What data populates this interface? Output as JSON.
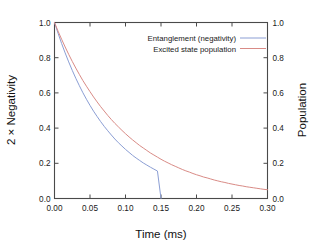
{
  "chart_data": {
    "type": "line",
    "title": "",
    "subtitle": "",
    "xlabel": "Time (ms)",
    "ylabel": "2 × Negativity",
    "ylabel_right": "Population",
    "xlim": [
      0.0,
      0.3
    ],
    "ylim": [
      0.0,
      1.0
    ],
    "ylim_right": [
      0.0,
      1.0
    ],
    "grid": false,
    "legend_position": "top-right-inside",
    "xticks": [
      0.0,
      0.05,
      0.1,
      0.15,
      0.2,
      0.25,
      0.3
    ],
    "xticklabels": [
      "0.00",
      "0.05",
      "0.10",
      "0.15",
      "0.20",
      "0.25",
      "0.30"
    ],
    "yticks": [
      0.0,
      0.2,
      0.4,
      0.6,
      0.8,
      1.0
    ],
    "yticklabels": [
      "0.0",
      "0.2",
      "0.4",
      "0.6",
      "0.8",
      "1.0"
    ],
    "yticks_right": [
      0.0,
      0.2,
      0.4,
      0.6,
      0.8,
      1.0
    ],
    "yticklabels_right": [
      "0.0",
      "0.2",
      "0.4",
      "0.6",
      "0.8",
      "1.0"
    ],
    "x": [
      0.0,
      0.005,
      0.01,
      0.015,
      0.02,
      0.025,
      0.03,
      0.035,
      0.04,
      0.045,
      0.05,
      0.055,
      0.06,
      0.065,
      0.07,
      0.075,
      0.08,
      0.085,
      0.09,
      0.095,
      0.1,
      0.105,
      0.11,
      0.115,
      0.12,
      0.125,
      0.13,
      0.135,
      0.14,
      0.145,
      0.15,
      0.155,
      0.16,
      0.165,
      0.17,
      0.175,
      0.18,
      0.185,
      0.19,
      0.195,
      0.2,
      0.205,
      0.21,
      0.215,
      0.22,
      0.225,
      0.23,
      0.235,
      0.24,
      0.245,
      0.25,
      0.255,
      0.26,
      0.265,
      0.27,
      0.275,
      0.28,
      0.285,
      0.29,
      0.295,
      0.3
    ],
    "series": [
      {
        "name": "Entanglement (negativity)",
        "color": "#8b9ed4",
        "axis": "left",
        "values": [
          1.0,
          0.939,
          0.881,
          0.827,
          0.776,
          0.728,
          0.683,
          0.641,
          0.601,
          0.564,
          0.529,
          0.496,
          0.466,
          0.437,
          0.41,
          0.385,
          0.361,
          0.338,
          0.317,
          0.298,
          0.279,
          0.262,
          0.245,
          0.23,
          0.216,
          0.202,
          0.19,
          0.178,
          0.167,
          0.156,
          0.0,
          0.0,
          0.0,
          0.0,
          0.0,
          0.0,
          0.0,
          0.0,
          0.0,
          0.0,
          0.0,
          0.0,
          0.0,
          0.0,
          0.0,
          0.0,
          0.0,
          0.0,
          0.0,
          0.0,
          0.0,
          0.0,
          0.0,
          0.0,
          0.0,
          0.0,
          0.0,
          0.0,
          0.0,
          0.0,
          0.0
        ]
      },
      {
        "name": "Excited state population",
        "color": "#d98b86",
        "axis": "right",
        "values": [
          1.0,
          0.951,
          0.905,
          0.861,
          0.819,
          0.779,
          0.741,
          0.705,
          0.67,
          0.638,
          0.607,
          0.577,
          0.549,
          0.522,
          0.497,
          0.472,
          0.449,
          0.427,
          0.407,
          0.387,
          0.368,
          0.35,
          0.333,
          0.317,
          0.301,
          0.287,
          0.273,
          0.259,
          0.247,
          0.235,
          0.223,
          0.212,
          0.202,
          0.192,
          0.183,
          0.174,
          0.165,
          0.157,
          0.15,
          0.142,
          0.135,
          0.129,
          0.122,
          0.117,
          0.111,
          0.105,
          0.1,
          0.095,
          0.091,
          0.086,
          0.082,
          0.078,
          0.074,
          0.071,
          0.067,
          0.064,
          0.061,
          0.058,
          0.055,
          0.052,
          0.05
        ]
      }
    ],
    "legend": [
      {
        "label": "Entanglement (negativity)",
        "color": "#8b9ed4"
      },
      {
        "label": "Excited state population",
        "color": "#d98b86"
      }
    ]
  }
}
